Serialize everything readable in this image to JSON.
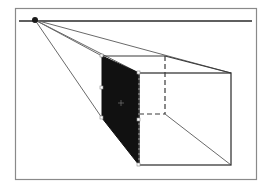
{
  "diagram": {
    "title": "",
    "type": "one-point perspective drawing",
    "colors": {
      "background": "#ffffff",
      "frame": "#8a8a8a",
      "lines": "#3a3a3a",
      "construction_lines": "#6a6a6a",
      "shaded_face": "#111111",
      "vanishing_point": "#1a1a1a"
    },
    "elements": {
      "horizon_line": "horizon line",
      "vanishing_point": "vanishing point",
      "box": "rectangular box in perspective",
      "shaded_face": "left side face (shaded)",
      "hidden_edges": "hidden edges (dashed)",
      "construction_lines": "orthogonal lines to vanishing point"
    }
  }
}
